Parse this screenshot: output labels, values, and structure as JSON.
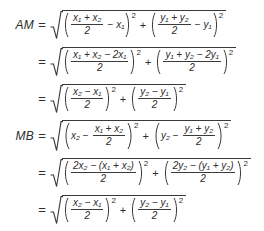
{
  "document": {
    "type": "math-derivation",
    "description": "Algebraic derivation of distances AM and MB to the midpoint",
    "text_color": "#2e2e2e",
    "background_color": "#ffffff",
    "equals_sign": "=",
    "plus_sign": "+",
    "minus_sign": "−",
    "exponent": "2",
    "denominator": "2",
    "radical_glyph": "square-root"
  },
  "lines": [
    {
      "label": "AM",
      "relation": "=",
      "term1": {
        "kind": "fraction-minus-variable",
        "fraction_numerator": "x₁ + x₂",
        "fraction_denominator": "2",
        "operator": "−",
        "trailing": "x₁",
        "exponent": "2"
      },
      "connector": "+",
      "term2": {
        "kind": "fraction-minus-variable",
        "fraction_numerator": "y₁ + y₂",
        "fraction_denominator": "2",
        "operator": "−",
        "trailing": "y₁",
        "exponent": "2"
      }
    },
    {
      "label": "",
      "relation": "=",
      "term1": {
        "kind": "single-fraction",
        "fraction_numerator": "x₁ + x₂ − 2x₁",
        "fraction_denominator": "2",
        "exponent": "2"
      },
      "connector": "+",
      "term2": {
        "kind": "single-fraction",
        "fraction_numerator": "y₁ + y₂ − 2y₁",
        "fraction_denominator": "2",
        "exponent": "2"
      }
    },
    {
      "label": "",
      "relation": "=",
      "term1": {
        "kind": "single-fraction",
        "fraction_numerator": "x₂ − x₁",
        "fraction_denominator": "2",
        "exponent": "2"
      },
      "connector": "+",
      "term2": {
        "kind": "single-fraction",
        "fraction_numerator": "y₂ − y₁",
        "fraction_denominator": "2",
        "exponent": "2"
      }
    },
    {
      "label": "MB",
      "relation": "=",
      "term1": {
        "kind": "variable-minus-fraction",
        "leading": "x₂",
        "operator": "−",
        "fraction_numerator": "x₁ + x₂",
        "fraction_denominator": "2",
        "exponent": "2"
      },
      "connector": "+",
      "term2": {
        "kind": "variable-minus-fraction",
        "leading": "y₂",
        "operator": "−",
        "fraction_numerator": "y₁ + y₂",
        "fraction_denominator": "2",
        "exponent": "2"
      }
    },
    {
      "label": "",
      "relation": "=",
      "term1": {
        "kind": "single-fraction",
        "fraction_numerator": "2x₂ − (x₁ + x₂)",
        "fraction_denominator": "2",
        "exponent": "2"
      },
      "connector": "+",
      "term2": {
        "kind": "single-fraction",
        "fraction_numerator": "2y₂ − (y₁ + y₂)",
        "fraction_denominator": "2",
        "exponent": "2"
      }
    },
    {
      "label": "",
      "relation": "=",
      "term1": {
        "kind": "single-fraction",
        "fraction_numerator": "x₂ − x₁",
        "fraction_denominator": "2",
        "exponent": "2"
      },
      "connector": "+",
      "term2": {
        "kind": "single-fraction",
        "fraction_numerator": "y₂ − y₁",
        "fraction_denominator": "2",
        "exponent": "2"
      }
    }
  ]
}
